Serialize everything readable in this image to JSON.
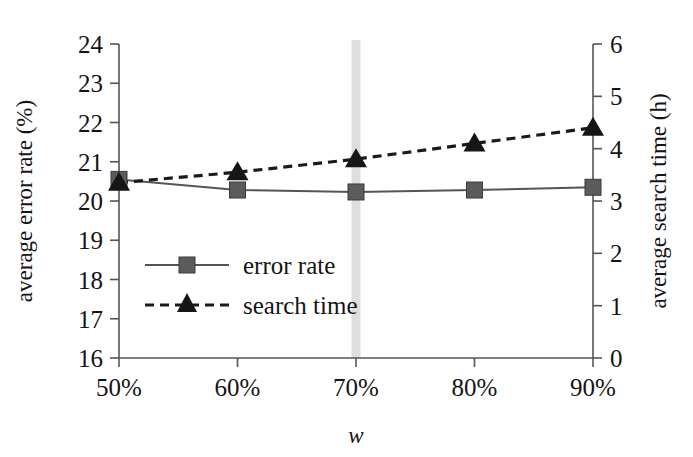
{
  "chart_data": {
    "type": "line",
    "title": "",
    "xlabel": "w",
    "categories": [
      "50%",
      "60%",
      "70%",
      "80%",
      "90%"
    ],
    "grid": false,
    "legend_position": "inside-left-middle",
    "highlight": {
      "category": "70%",
      "color": "#d8d8d8",
      "label": "70%"
    },
    "axes": {
      "left": {
        "label": "average error rate (%)",
        "ticks": [
          "16",
          "17",
          "18",
          "19",
          "20",
          "21",
          "22",
          "23",
          "24"
        ],
        "min": 16,
        "max": 24,
        "step": 1
      },
      "right": {
        "label": "average search time (h)",
        "ticks": [
          "0",
          "1",
          "2",
          "3",
          "4",
          "5",
          "6"
        ],
        "min": 0,
        "max": 6,
        "step": 1
      },
      "x": {
        "label": "w",
        "ticks": [
          "50%",
          "60%",
          "70%",
          "80%",
          "90%"
        ]
      }
    },
    "series": [
      {
        "name": "error rate",
        "axis": "left",
        "marker": "square",
        "line_style": "solid",
        "color": "#555555",
        "values": [
          20.55,
          20.28,
          20.23,
          20.28,
          20.35
        ]
      },
      {
        "name": "search time",
        "axis": "right",
        "marker": "triangle",
        "line_style": "dashed",
        "color": "#161616",
        "values": [
          3.35,
          3.55,
          3.8,
          4.1,
          4.4
        ]
      }
    ],
    "legend": [
      {
        "label": "error rate",
        "marker": "square",
        "line_style": "solid"
      },
      {
        "label": "search time",
        "marker": "triangle",
        "line_style": "dashed"
      }
    ]
  }
}
